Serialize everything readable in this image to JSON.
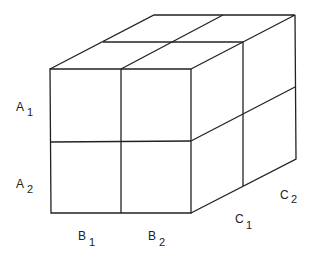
{
  "diagram": {
    "type": "2x2x2 factorial cube",
    "row_labels": [
      {
        "letter": "A",
        "sub": "1"
      },
      {
        "letter": "A",
        "sub": "2"
      }
    ],
    "column_labels": [
      {
        "letter": "B",
        "sub": "1"
      },
      {
        "letter": "B",
        "sub": "2"
      }
    ],
    "depth_labels": [
      {
        "letter": "C",
        "sub": "1"
      },
      {
        "letter": "C",
        "sub": "2"
      }
    ],
    "line_color": "#222222"
  }
}
